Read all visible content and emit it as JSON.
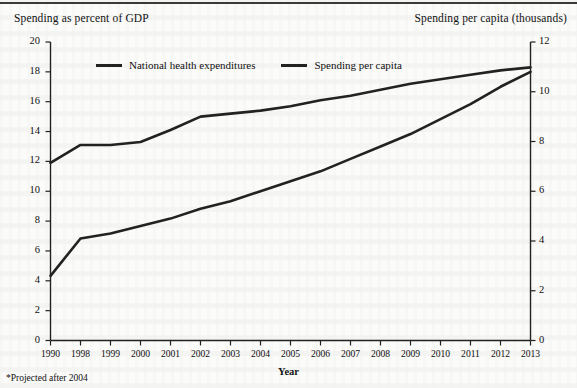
{
  "chart_data": {
    "type": "line",
    "title": "",
    "xlabel": "Year",
    "left_axis_title": "Spending as percent of GDP",
    "right_axis_title": "Spending per capita (thousands)",
    "footnote": "*Projected after 2004",
    "grid": false,
    "legend_position": "top-inside",
    "x": [
      "1990",
      "1998",
      "1999",
      "2000",
      "2001",
      "2002",
      "2003",
      "2004",
      "2005",
      "2006",
      "2007",
      "2008",
      "2009",
      "2010",
      "2011",
      "2012",
      "2013"
    ],
    "xtick_labels": [
      "1990",
      "1998",
      "1999",
      "2000",
      "2001",
      "2002",
      "2003",
      "2004",
      "2005",
      "2006",
      "2007",
      "2008",
      "2009",
      "2010",
      "2011",
      "2012",
      "2013"
    ],
    "left_ylim": [
      0,
      20
    ],
    "left_yticks": [
      0,
      2,
      4,
      6,
      8,
      10,
      12,
      14,
      16,
      18,
      20
    ],
    "left_ytick_labels": [
      "0",
      "2",
      "4",
      "6",
      "8",
      "10",
      "12",
      "14",
      "16",
      "18",
      "20"
    ],
    "right_ylim": [
      0,
      12
    ],
    "right_yticks": [
      0,
      2,
      4,
      6,
      8,
      10,
      12
    ],
    "right_ytick_labels": [
      "0",
      "2",
      "4",
      "6",
      "8",
      "10",
      "12"
    ],
    "series": [
      {
        "name": "National health expenditures",
        "axis": "left",
        "color": "#222222",
        "values": [
          11.9,
          13.1,
          13.1,
          13.3,
          14.1,
          15.0,
          15.2,
          15.4,
          15.7,
          16.1,
          16.4,
          16.8,
          17.2,
          17.5,
          17.8,
          18.1,
          18.3
        ]
      },
      {
        "name": "Spending per capita",
        "axis": "right",
        "color": "#222222",
        "values": [
          2.6,
          4.1,
          4.3,
          4.6,
          4.9,
          5.3,
          5.6,
          6.0,
          6.4,
          6.8,
          7.3,
          7.8,
          8.3,
          8.9,
          9.5,
          10.2,
          10.8
        ]
      }
    ],
    "legend": [
      {
        "label": "National health expenditures",
        "swatch": "line-swatch"
      },
      {
        "label": "Spending per capita",
        "swatch": "line-swatch"
      }
    ]
  }
}
